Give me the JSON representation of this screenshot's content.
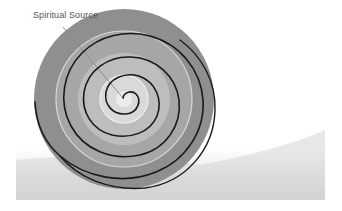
{
  "diagram": {
    "label": "Spiritual Source",
    "colors": {
      "background": "#ffffff",
      "outer_ring": "#8f8f8f",
      "middle_ring": "#a9a9a9",
      "inner_ring": "#c4c4c4",
      "core": "#dcdcdc",
      "spiral": "#1a1a1a",
      "highlight": "#eeeeee",
      "leader_line": "#888888",
      "ground_shadow": "#d2d2d2"
    }
  }
}
